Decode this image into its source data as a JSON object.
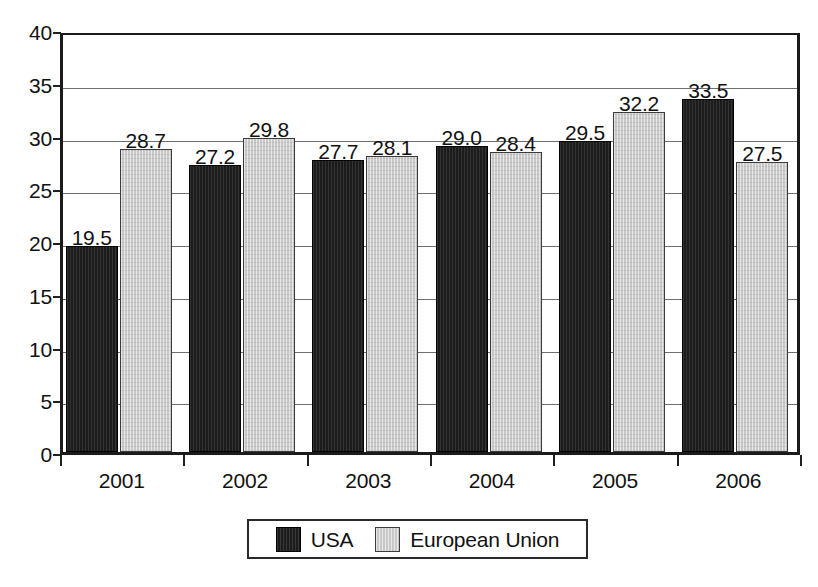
{
  "chart_data": {
    "type": "bar",
    "title": "",
    "subtitle": "",
    "xlabel": "",
    "ylabel": "",
    "categories": [
      "2001",
      "2002",
      "2003",
      "2004",
      "2005",
      "2006"
    ],
    "series": [
      {
        "name": "USA",
        "color": "#1c1c1c",
        "values": [
          19.5,
          27.2,
          27.7,
          29.0,
          29.5,
          33.5
        ],
        "labels": [
          "19.5",
          "27.2",
          "27.7",
          "29.0",
          "29.5",
          "33.5"
        ]
      },
      {
        "name": "European Union",
        "color": "#c9c9c9",
        "values": [
          28.7,
          29.8,
          28.1,
          28.4,
          32.2,
          27.5
        ],
        "labels": [
          "28.7",
          "29.8",
          "28.1",
          "28.4",
          "32.2",
          "27.5"
        ]
      }
    ],
    "ylim": [
      0,
      40
    ],
    "ytick_labels": [
      "40",
      "35",
      "30",
      "25",
      "20",
      "15",
      "10",
      "5",
      "0"
    ],
    "ytick_values": [
      40,
      35,
      30,
      25,
      20,
      15,
      10,
      5,
      0
    ],
    "grid": true,
    "grid_axis": "y",
    "legend_position": "bottom-center",
    "data_labels": true
  },
  "legend": {
    "entries": [
      {
        "label": "USA",
        "swatch": "usa"
      },
      {
        "label": "European Union",
        "swatch": "eu"
      }
    ]
  }
}
